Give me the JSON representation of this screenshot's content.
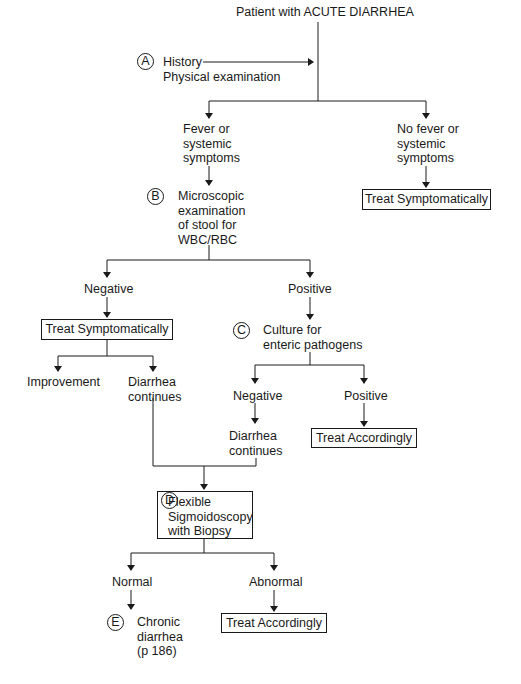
{
  "colors": {
    "ink": "#1a1a1a",
    "background": "#ffffff"
  },
  "title": "Patient with ACUTE DIARRHEA",
  "step_a": {
    "marker": "A",
    "line1": "History",
    "line2": "Physical examination"
  },
  "branch1": {
    "left": {
      "lines": [
        "Fever or",
        "systemic",
        "symptoms"
      ]
    },
    "right": {
      "lines": [
        "No fever or",
        "systemic",
        "symptoms"
      ],
      "action": "Treat Symptomatically"
    }
  },
  "step_b": {
    "marker": "B",
    "lines": [
      "Microscopic",
      "examination",
      "of stool for",
      "WBC/RBC"
    ]
  },
  "branch2": {
    "negative": {
      "label": "Negative",
      "action": "Treat Symptomatically",
      "outcomes": {
        "left": "Improvement",
        "right": [
          "Diarrhea",
          "continues"
        ]
      }
    },
    "positive": {
      "label": "Positive"
    }
  },
  "step_c": {
    "marker": "C",
    "lines": [
      "Culture for",
      "enteric pathogens"
    ],
    "negative": {
      "label": "Negative",
      "result": [
        "Diarrhea",
        "continues"
      ]
    },
    "positive": {
      "label": "Positive",
      "action": "Treat Accordingly"
    }
  },
  "step_d": {
    "marker": "D",
    "lines": [
      "Flexible",
      "Sigmoidoscopy",
      "with Biopsy"
    ],
    "normal": "Normal",
    "abnormal": "Abnormal",
    "abnormal_action": "Treat Accordingly"
  },
  "step_e": {
    "marker": "E",
    "lines": [
      "Chronic",
      "diarrhea",
      "(p 186)"
    ]
  }
}
